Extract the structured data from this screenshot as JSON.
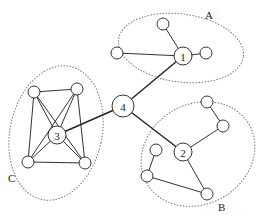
{
  "diagram": {
    "clusters": [
      {
        "label": "A",
        "cx": 181,
        "cy": 48,
        "rx": 63,
        "ry": 34,
        "rot": 8,
        "lx": 205,
        "ly": 19
      },
      {
        "label": "B",
        "cx": 198,
        "cy": 154,
        "rx": 59,
        "ry": 50,
        "rot": -30,
        "lx": 218,
        "ly": 211
      },
      {
        "label": "C",
        "cx": 56,
        "cy": 133,
        "rx": 46,
        "ry": 68,
        "rot": 12,
        "lx": 8,
        "ly": 182
      }
    ],
    "hubs": [
      {
        "id": "1",
        "label": "1",
        "x": 183,
        "y": 56,
        "r": 9
      },
      {
        "id": "2",
        "label": "2",
        "x": 183,
        "y": 152,
        "r": 9
      },
      {
        "id": "3",
        "label": "3",
        "x": 57,
        "y": 135,
        "r": 9
      },
      {
        "id": "4",
        "label": "4",
        "x": 123,
        "y": 106,
        "r": 11
      }
    ],
    "leaves": [
      {
        "id": "a1",
        "x": 163,
        "y": 24,
        "r": 6
      },
      {
        "id": "a2",
        "x": 117,
        "y": 53,
        "r": 6
      },
      {
        "id": "a3",
        "x": 206,
        "y": 53,
        "r": 6
      },
      {
        "id": "b1",
        "x": 207,
        "y": 102,
        "r": 6
      },
      {
        "id": "b2",
        "x": 223,
        "y": 126,
        "r": 6
      },
      {
        "id": "b3",
        "x": 156,
        "y": 150,
        "r": 6
      },
      {
        "id": "b4",
        "x": 147,
        "y": 176,
        "r": 6
      },
      {
        "id": "b5",
        "x": 207,
        "y": 194,
        "r": 6
      },
      {
        "id": "c1",
        "x": 34,
        "y": 92,
        "r": 6
      },
      {
        "id": "c2",
        "x": 77,
        "y": 89,
        "r": 6
      },
      {
        "id": "c3",
        "x": 28,
        "y": 162,
        "r": 6
      },
      {
        "id": "c4",
        "x": 85,
        "y": 163,
        "r": 6
      }
    ],
    "edges": [
      {
        "from": "1",
        "to": "a1"
      },
      {
        "from": "1",
        "to": "a2"
      },
      {
        "from": "1",
        "to": "a3"
      },
      {
        "from": "2",
        "to": "b2"
      },
      {
        "from": "b2",
        "to": "b1"
      },
      {
        "from": "2",
        "to": "b5"
      },
      {
        "from": "b5",
        "to": "b4"
      },
      {
        "from": "b4",
        "to": "b3"
      },
      {
        "from": "c1",
        "to": "c2"
      },
      {
        "from": "c1",
        "to": "c3"
      },
      {
        "from": "c1",
        "to": "c4"
      },
      {
        "from": "c1",
        "to": "3"
      },
      {
        "from": "c2",
        "to": "c3"
      },
      {
        "from": "c2",
        "to": "c4"
      },
      {
        "from": "c2",
        "to": "3"
      },
      {
        "from": "c3",
        "to": "c4"
      },
      {
        "from": "c3",
        "to": "3"
      },
      {
        "from": "c4",
        "to": "3"
      }
    ],
    "bridges": [
      {
        "from": "4",
        "to": "1"
      },
      {
        "from": "4",
        "to": "2"
      },
      {
        "from": "4",
        "to": "3"
      }
    ]
  }
}
